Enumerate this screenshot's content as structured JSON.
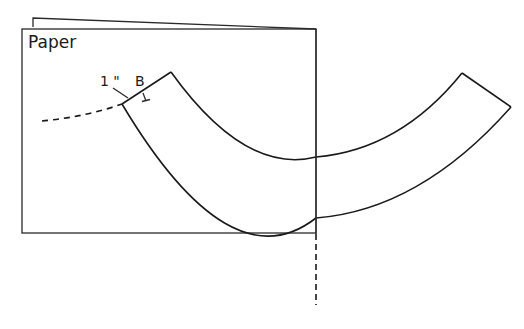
{
  "diagram": {
    "paper_label": "Paper",
    "dimension_label": "1 \"",
    "point_label": "B",
    "colors": {
      "line": "#1a1a1a",
      "background": "#ffffff"
    }
  }
}
